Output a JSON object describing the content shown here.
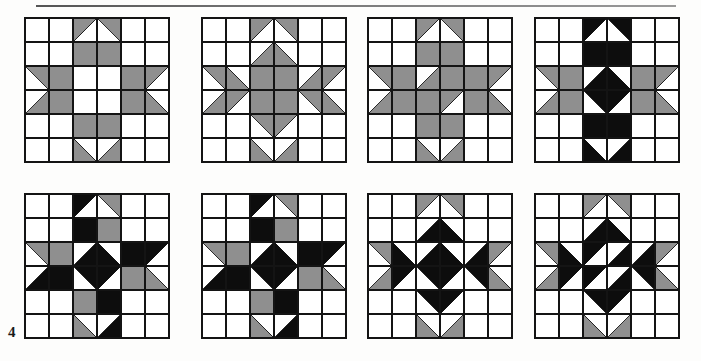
{
  "page": {
    "page_number": "4",
    "has_top_rule": true,
    "background_color": "#fdfdfc"
  },
  "palette": {
    "white": "#ffffff",
    "gray": "#8f8f8f",
    "black": "#0d0d0d",
    "line": "#141414"
  },
  "grid": {
    "columns": 6,
    "rows": 6,
    "cell_size": 24,
    "blocks_per_row": 4,
    "block_rows": 2,
    "total_blocks": 8
  },
  "blocks": [
    {
      "id": "block-1",
      "name": "Sawtooth Star Variation 1",
      "row": 1,
      "column": 1,
      "colors_used": [
        "white",
        "gray"
      ],
      "cells": [
        [
          "W",
          "W",
          "TL-G",
          "TR-G",
          "W",
          "W"
        ],
        [
          "W",
          "W",
          "G",
          "G",
          "W",
          "W"
        ],
        [
          "TR-G",
          "G",
          "W",
          "W",
          "G",
          "TL-G"
        ],
        [
          "BR-G",
          "G",
          "W",
          "W",
          "G",
          "BL-G"
        ],
        [
          "W",
          "W",
          "G",
          "G",
          "W",
          "W"
        ],
        [
          "W",
          "W",
          "BL-G",
          "BR-G",
          "W",
          "W"
        ]
      ]
    },
    {
      "id": "block-2",
      "name": "Eight Point Star Variation",
      "row": 1,
      "column": 2,
      "colors_used": [
        "white",
        "gray"
      ],
      "cells": [
        [
          "W",
          "W",
          "TL-G",
          "TR-G",
          "W",
          "W"
        ],
        [
          "W",
          "W",
          "BR-G",
          "BL-G",
          "W",
          "W"
        ],
        [
          "TR-G",
          "BL-G",
          "G",
          "G",
          "BR-G",
          "TL-G"
        ],
        [
          "BR-G",
          "TL-G",
          "G",
          "G",
          "TR-G",
          "BL-G"
        ],
        [
          "W",
          "W",
          "TR-G",
          "TL-G",
          "W",
          "W"
        ],
        [
          "W",
          "W",
          "BL-G",
          "BR-G",
          "W",
          "W"
        ]
      ]
    },
    {
      "id": "block-3",
      "name": "Star with Pinwheel Center",
      "row": 1,
      "column": 3,
      "colors_used": [
        "white",
        "gray"
      ],
      "cells": [
        [
          "W",
          "W",
          "TL-G",
          "TR-G",
          "W",
          "W"
        ],
        [
          "W",
          "W",
          "G",
          "G",
          "W",
          "W"
        ],
        [
          "TR-G",
          "G",
          "BR-G",
          "G",
          "G",
          "TL-G"
        ],
        [
          "BR-G",
          "G",
          "G",
          "TL-G",
          "G",
          "BL-G"
        ],
        [
          "W",
          "W",
          "G",
          "G",
          "W",
          "W"
        ],
        [
          "W",
          "W",
          "BL-G",
          "BR-G",
          "W",
          "W"
        ]
      ]
    },
    {
      "id": "block-4",
      "name": "Two Tone Star, Black Cross",
      "row": 1,
      "column": 4,
      "colors_used": [
        "white",
        "gray",
        "black"
      ],
      "cells": [
        [
          "W",
          "W",
          "TL-K",
          "TR-K",
          "W",
          "W"
        ],
        [
          "W",
          "W",
          "K",
          "K",
          "W",
          "W"
        ],
        [
          "TR-G",
          "G",
          "BR-K",
          "BL-K",
          "G",
          "TL-G"
        ],
        [
          "BR-G",
          "G",
          "TR-K",
          "TL-K",
          "G",
          "BL-G"
        ],
        [
          "W",
          "W",
          "K",
          "K",
          "W",
          "W"
        ],
        [
          "W",
          "W",
          "BL-K",
          "BR-K",
          "W",
          "W"
        ]
      ]
    },
    {
      "id": "block-5",
      "name": "Scrappy Star, Mixed Values",
      "row": 2,
      "column": 1,
      "colors_used": [
        "white",
        "gray",
        "black"
      ],
      "cells": [
        [
          "W",
          "W",
          "TL-K",
          "TR-G",
          "W",
          "W"
        ],
        [
          "W",
          "W",
          "K",
          "G",
          "W",
          "W"
        ],
        [
          "TR-G",
          "G",
          "BR-K",
          "BL-K",
          "K",
          "TL-K"
        ],
        [
          "BR-K",
          "K",
          "TR-K",
          "TL-K",
          "G",
          "BL-G"
        ],
        [
          "W",
          "W",
          "G",
          "K",
          "W",
          "W"
        ],
        [
          "W",
          "W",
          "BL-G",
          "BR-K",
          "W",
          "W"
        ]
      ]
    },
    {
      "id": "block-6",
      "name": "Rotating Pinwheel Star",
      "row": 2,
      "column": 2,
      "colors_used": [
        "white",
        "gray",
        "black"
      ],
      "cells": [
        [
          "W",
          "W",
          "TL-K",
          "TR-G",
          "W",
          "W"
        ],
        [
          "W",
          "W",
          "K",
          "G",
          "W",
          "W"
        ],
        [
          "TR-G",
          "G",
          "BR-K",
          "BL-K",
          "K",
          "TL-K"
        ],
        [
          "BR-K",
          "K",
          "TR-K",
          "TL-K",
          "G",
          "BL-G"
        ],
        [
          "W",
          "W",
          "G",
          "K",
          "W",
          "W"
        ],
        [
          "W",
          "W",
          "BL-G",
          "BR-K",
          "W",
          "W"
        ]
      ]
    },
    {
      "id": "block-7",
      "name": "Diamond Ring Star",
      "row": 2,
      "column": 3,
      "colors_used": [
        "white",
        "gray",
        "black"
      ],
      "cells": [
        [
          "W",
          "W",
          "TL-G",
          "TR-G",
          "W",
          "W"
        ],
        [
          "W",
          "W",
          "BR-K",
          "BL-K",
          "W",
          "W"
        ],
        [
          "TR-G",
          "BL-K",
          "BR-K",
          "BL-K",
          "BR-K",
          "TL-G"
        ],
        [
          "BR-G",
          "TL-K",
          "TR-K",
          "TL-K",
          "TR-K",
          "BL-G"
        ],
        [
          "W",
          "W",
          "TR-K",
          "TL-K",
          "W",
          "W"
        ],
        [
          "W",
          "W",
          "BL-G",
          "BR-G",
          "W",
          "W"
        ]
      ]
    },
    {
      "id": "block-8",
      "name": "Black Pinwheel Star",
      "row": 2,
      "column": 4,
      "colors_used": [
        "white",
        "gray",
        "black"
      ],
      "cells": [
        [
          "W",
          "W",
          "TL-G",
          "TR-G",
          "W",
          "W"
        ],
        [
          "W",
          "W",
          "BR-K",
          "BL-K",
          "W",
          "W"
        ],
        [
          "TR-G",
          "BL-K",
          "TL-K",
          "BR-K",
          "BR-K",
          "TL-G"
        ],
        [
          "BR-G",
          "TL-K",
          "TL-K",
          "BR-K",
          "TR-K",
          "BL-G"
        ],
        [
          "W",
          "W",
          "TR-K",
          "TL-K",
          "W",
          "W"
        ],
        [
          "W",
          "W",
          "BL-G",
          "BR-G",
          "W",
          "W"
        ]
      ]
    }
  ]
}
